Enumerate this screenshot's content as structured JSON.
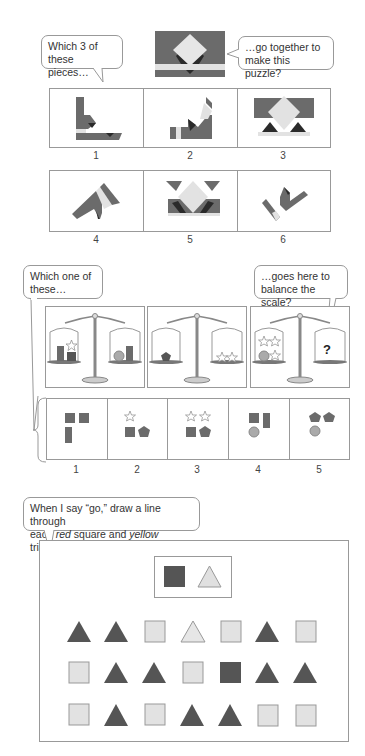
{
  "colors": {
    "dark_gray": "#6b6b6b",
    "black": "#2a2a2a",
    "light_gray": "#e2e2e2",
    "border": "#999999",
    "shape_light": "#e0e0e0"
  },
  "puzzle_section": {
    "bubble_left": "Which 3 of\nthese pieces…",
    "bubble_left_line1": "Which 3 of",
    "bubble_left_line2": "these pieces…",
    "bubble_right_line1": "…go together to",
    "bubble_right_line2": "make this puzzle?",
    "target_image": "puzzle-target",
    "pieces": [
      {
        "label": "1"
      },
      {
        "label": "2"
      },
      {
        "label": "3"
      },
      {
        "label": "4"
      },
      {
        "label": "5"
      },
      {
        "label": "6"
      }
    ]
  },
  "scale_section": {
    "bubble_left_line1": "Which one of",
    "bubble_left_line2": "these…",
    "bubble_right_line1": "…goes here to",
    "bubble_right_line2": "balance the scale?",
    "question_mark": "?",
    "scales": [
      {
        "left": [
          "rectangle",
          "square+star"
        ],
        "right": [
          "circle",
          "rectangle"
        ]
      },
      {
        "left": [
          "pentagon"
        ],
        "right": [
          "star",
          "star"
        ]
      },
      {
        "left": [
          "star",
          "star",
          "circle",
          "star"
        ],
        "right": [
          "?"
        ]
      }
    ],
    "options": [
      {
        "label": "1",
        "shapes": [
          "square",
          "square",
          "rectangle"
        ]
      },
      {
        "label": "2",
        "shapes": [
          "star",
          "square",
          "pentagon"
        ]
      },
      {
        "label": "3",
        "shapes": [
          "star",
          "star",
          "square",
          "pentagon"
        ]
      },
      {
        "label": "4",
        "shapes": [
          "square",
          "rectangle",
          "circle"
        ]
      },
      {
        "label": "5",
        "shapes": [
          "pentagon",
          "pentagon",
          "circle"
        ]
      }
    ]
  },
  "attention_section": {
    "bubble_line1": "When I say “go,” draw a line through",
    "bubble_line2_pre": "each ",
    "bubble_line2_red": "red",
    "bubble_line2_mid": " square and ",
    "bubble_line2_yellow": "yellow",
    "bubble_line2_post": " triangle.",
    "key": [
      "dark-square",
      "light-triangle"
    ],
    "rows": [
      [
        "dark-triangle",
        "dark-triangle",
        "light-square",
        "light-triangle",
        "light-square",
        "dark-triangle",
        "light-square"
      ],
      [
        "light-square",
        "dark-triangle",
        "dark-triangle",
        "light-square",
        "dark-square",
        "dark-triangle",
        "dark-triangle"
      ],
      [
        "light-square",
        "dark-triangle",
        "light-square",
        "dark-triangle",
        "dark-triangle",
        "light-square",
        "light-square"
      ]
    ]
  }
}
